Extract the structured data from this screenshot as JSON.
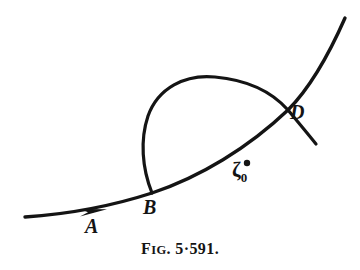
{
  "figure": {
    "caption_prefix": "F",
    "caption_smallcaps": "IG",
    "caption_number": ". 5·591.",
    "caption_full": "FIG. 5·591.",
    "background_color": "#ffffff",
    "ink_color": "#141414"
  },
  "labels": {
    "a": "A",
    "b": "B",
    "d": "D",
    "zeta": "ζ",
    "zeta_subscript": "0",
    "zeta_full": "ζ0"
  },
  "geometry": {
    "main_curve_path": "M 25,217 C 70,214 112,206 152,193 C 200,177 248,148 288,110 C 310,88 330,52 345,18",
    "loop_path": "M 152,193 C 142,168 140,140 148,116 C 158,88 185,74 215,77 C 248,80 272,92 288,110 C 300,124 312,140 322,152",
    "arrow_tip_x": 106,
    "arrow_tip_y": 209,
    "marker_x": 247,
    "marker_y": 163,
    "marker_radius": 3.2,
    "stroke_width_main": 3.4,
    "stroke_width_loop": 3.2
  }
}
